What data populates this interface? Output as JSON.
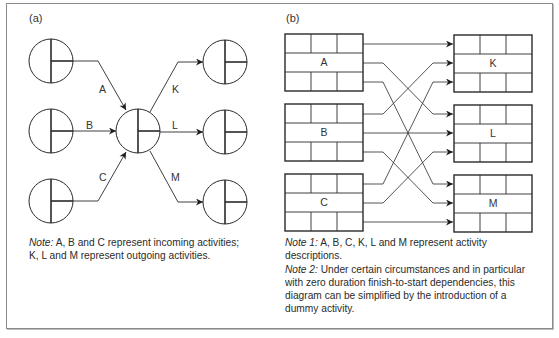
{
  "panel_a": {
    "label": "(a)",
    "incoming_activities": [
      {
        "id": "A",
        "label": "A"
      },
      {
        "id": "B",
        "label": "B"
      },
      {
        "id": "C",
        "label": "C"
      }
    ],
    "outgoing_activities": [
      {
        "id": "K",
        "label": "K"
      },
      {
        "id": "L",
        "label": "L"
      },
      {
        "id": "M",
        "label": "M"
      }
    ],
    "note": {
      "prefix": "Note:",
      "line1": " A, B and C represent incoming activities;",
      "line2": "K, L and M represent outgoing activities."
    }
  },
  "panel_b": {
    "label": "(b)",
    "left_boxes": [
      {
        "id": "A",
        "label": "A"
      },
      {
        "id": "B",
        "label": "B"
      },
      {
        "id": "C",
        "label": "C"
      }
    ],
    "right_boxes": [
      {
        "id": "K",
        "label": "K"
      },
      {
        "id": "L",
        "label": "L"
      },
      {
        "id": "M",
        "label": "M"
      }
    ],
    "dependencies": [
      [
        "A",
        "K"
      ],
      [
        "A",
        "L"
      ],
      [
        "A",
        "M"
      ],
      [
        "B",
        "K"
      ],
      [
        "B",
        "L"
      ],
      [
        "B",
        "M"
      ],
      [
        "C",
        "K"
      ],
      [
        "C",
        "L"
      ],
      [
        "C",
        "M"
      ]
    ],
    "note1": {
      "prefix": "Note 1:",
      "line1": " A, B, C, K, L and M represent activity",
      "line2": "descriptions."
    },
    "note2": {
      "prefix": "Note 2:",
      "line1": " Under certain circumstances and in particular",
      "line2": "with zero duration finish-to-start dependencies, this",
      "line3": "diagram can be simplified by the introduction of a",
      "line4": "dummy activity."
    }
  },
  "colors": {
    "stroke": "#2a2a2a",
    "frame": "#8a8a8a",
    "text": "#2b2b2b"
  }
}
